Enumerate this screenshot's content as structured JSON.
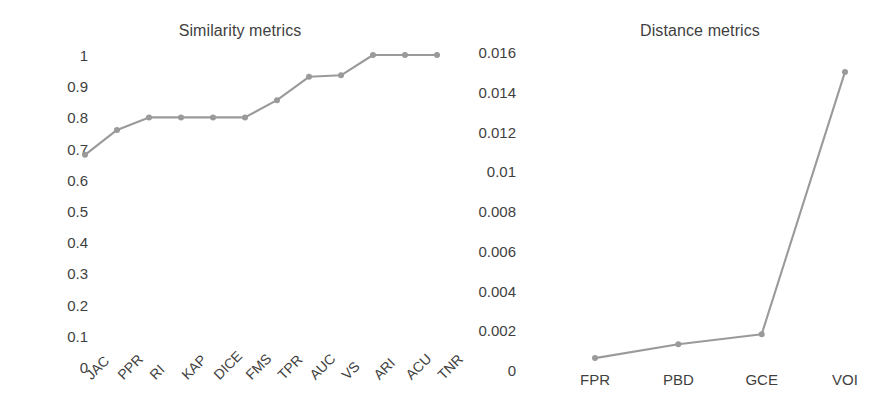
{
  "figure": {
    "background_color": "#ffffff",
    "series_color": "#9a9a9a",
    "text_color": "#3f3f3f"
  },
  "chart_data": [
    {
      "type": "line",
      "id": "similarity",
      "title": "Similarity metrics",
      "xlabel": "",
      "ylabel": "",
      "categories": [
        "JAC",
        "PPR",
        "RI",
        "KAP",
        "DICE",
        "FMS",
        "TPR",
        "AUC",
        "VS",
        "ARI",
        "ACU",
        "TNR"
      ],
      "values": [
        0.68,
        0.76,
        0.8,
        0.8,
        0.8,
        0.8,
        0.855,
        0.93,
        0.935,
        1,
        1,
        1
      ],
      "ylim": [
        0,
        1
      ],
      "yticks": [
        0,
        0.1,
        0.2,
        0.3,
        0.4,
        0.5,
        0.6,
        0.7,
        0.8,
        0.9,
        1
      ],
      "ytick_labels": [
        "0",
        "0.1",
        "0.2",
        "0.3",
        "0.4",
        "0.5",
        "0.6",
        "0.7",
        "0.8",
        "0.9",
        "1"
      ],
      "grid": false,
      "legend": "none",
      "marker": "circle",
      "xtick_rotation": -45
    },
    {
      "type": "line",
      "id": "distance",
      "title": "Distance metrics",
      "xlabel": "",
      "ylabel": "",
      "categories": [
        "FPR",
        "PBD",
        "GCE",
        "VOI"
      ],
      "values": [
        0.0006,
        0.0013,
        0.0018,
        0.015
      ],
      "ylim": [
        0,
        0.016
      ],
      "yticks": [
        0,
        0.002,
        0.004,
        0.006,
        0.008,
        0.01,
        0.012,
        0.014,
        0.016
      ],
      "ytick_labels": [
        "0",
        "0.002",
        "0.004",
        "0.006",
        "0.008",
        "0.01",
        "0.012",
        "0.014",
        "0.016"
      ],
      "grid": false,
      "legend": "none",
      "marker": "circle",
      "xtick_rotation": 0
    }
  ]
}
